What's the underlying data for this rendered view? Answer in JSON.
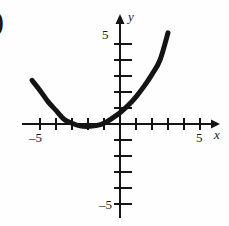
{
  "figure": {
    "stray_glyph": ")",
    "background_color": "#fefefe",
    "ink_color": "#141414"
  },
  "axes": {
    "x_name": "x",
    "y_name": "y",
    "x_positive_label": "5",
    "x_negative_label": "–5",
    "y_positive_label": "5",
    "y_negative_label": "–5",
    "origin_px": {
      "x": 120,
      "y": 124
    },
    "unit_px": 16,
    "arrowheads": [
      "x-positive",
      "y-positive"
    ]
  },
  "chart_data": {
    "type": "line",
    "title": "",
    "xlabel": "x",
    "ylabel": "y",
    "xlim": [
      -6.5,
      6.5
    ],
    "ylim": [
      -6.3,
      6.0
    ],
    "grid": false,
    "legend": null,
    "xticks": [
      -5,
      -4,
      -3,
      -2,
      -1,
      1,
      2,
      3,
      4,
      5
    ],
    "yticks": [
      -5,
      -4,
      -3,
      -2,
      -1,
      1,
      2,
      3,
      4,
      5
    ],
    "xtick_labels_shown": [
      "-5",
      "5"
    ],
    "ytick_labels_shown": [
      "-5",
      "5"
    ],
    "series": [
      {
        "name": "parabola",
        "shape": "upward parabola",
        "vertex": [
          -2,
          -0.15
        ],
        "x_domain": [
          -5.5,
          3.0
        ],
        "x": [
          -5.5,
          -5.0,
          -4.5,
          -4.0,
          -3.5,
          -3.0,
          -2.5,
          -2.0,
          -1.5,
          -1.0,
          -0.5,
          0.0,
          0.5,
          1.0,
          1.5,
          2.0,
          2.5,
          3.0
        ],
        "y": [
          2.73,
          2.1,
          1.4,
          0.85,
          0.3,
          0.05,
          -0.12,
          -0.15,
          -0.1,
          0.05,
          0.35,
          0.7,
          1.15,
          1.7,
          2.35,
          3.1,
          4.0,
          5.7
        ],
        "stroke_width_px": 5,
        "color": "#141414"
      }
    ]
  }
}
